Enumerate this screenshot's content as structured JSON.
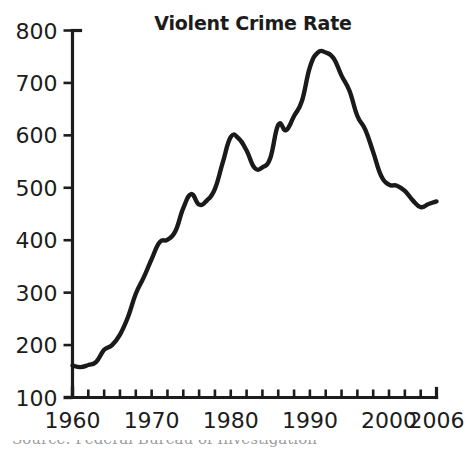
{
  "chart_data": {
    "type": "line",
    "title": "Violent Crime Rate",
    "xlabel": "",
    "ylabel": "",
    "xlim": [
      1960,
      2006
    ],
    "ylim": [
      100,
      800
    ],
    "ytick_step": 100,
    "xtick_step": 2,
    "grid": false,
    "legend": "none",
    "line_color": "#1a1a1a",
    "ytick_labels": [
      "100",
      "200",
      "300",
      "400",
      "500",
      "600",
      "700",
      "800"
    ],
    "ytick_values": [
      100,
      200,
      300,
      400,
      500,
      600,
      700,
      800
    ],
    "xtick_labels": [
      "1960",
      "1970",
      "1980",
      "1990",
      "2000",
      "2006"
    ],
    "xtick_label_values": [
      1960,
      1970,
      1980,
      1990,
      2000,
      2006
    ],
    "xtick_values": [
      1960,
      1962,
      1964,
      1966,
      1968,
      1970,
      1972,
      1974,
      1976,
      1978,
      1980,
      1982,
      1984,
      1986,
      1988,
      1990,
      1992,
      1994,
      1996,
      1998,
      2000,
      2002,
      2004,
      2006
    ],
    "x": [
      1960,
      1961,
      1962,
      1963,
      1964,
      1965,
      1966,
      1967,
      1968,
      1969,
      1970,
      1971,
      1972,
      1973,
      1974,
      1975,
      1976,
      1977,
      1978,
      1979,
      1980,
      1981,
      1982,
      1983,
      1984,
      1985,
      1986,
      1987,
      1988,
      1989,
      1990,
      1991,
      1992,
      1993,
      1994,
      1995,
      1996,
      1997,
      1998,
      1999,
      2000,
      2001,
      2002,
      2003,
      2004,
      2005,
      2006
    ],
    "values": [
      161,
      158,
      162,
      168,
      191,
      200,
      220,
      253,
      298,
      329,
      364,
      396,
      401,
      417,
      461,
      488,
      468,
      476,
      498,
      549,
      597,
      594,
      571,
      538,
      539,
      557,
      620,
      610,
      637,
      666,
      730,
      758,
      758,
      747,
      714,
      685,
      637,
      611,
      568,
      523,
      506,
      504,
      494,
      476,
      463,
      469,
      474
    ],
    "annotations": [],
    "footnote": "Source: Federal Bureau of Investigation"
  },
  "page": {
    "title": "Violent Crime Rate"
  }
}
